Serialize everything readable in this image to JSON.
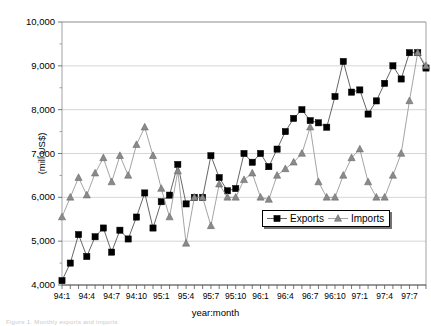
{
  "chart_data": {
    "type": "line",
    "title": "",
    "xlabel": "year:month",
    "ylabel": "(mill US$)",
    "ylim": [
      4000,
      10000
    ],
    "ytick_values": [
      4000,
      5000,
      6000,
      7000,
      8000,
      9000,
      10000
    ],
    "ytick_labels": [
      "4,000",
      "5,000",
      "6,000",
      "7,000",
      "8,000",
      "9,000",
      "10,000"
    ],
    "grid": true,
    "legend_position": "inside-lower-right",
    "x": [
      "94:1",
      "94:2",
      "94:3",
      "94:4",
      "94:5",
      "94:6",
      "94:7",
      "94:8",
      "94:9",
      "94:10",
      "94:11",
      "94:12",
      "95:1",
      "95:2",
      "95:3",
      "95:4",
      "95:5",
      "95:6",
      "95:7",
      "95:8",
      "95:9",
      "95:10",
      "95:11",
      "95:12",
      "96:1",
      "96:2",
      "96:3",
      "96:4",
      "96:5",
      "96:6",
      "96:7",
      "96:8",
      "96:9",
      "96:10",
      "96:11",
      "96:12",
      "97:1",
      "97:2",
      "97:3",
      "97:4",
      "97:5",
      "97:6",
      "97:7",
      "97:8",
      "97:9"
    ],
    "xtick_labels": [
      "94:1",
      "94:4",
      "94:7",
      "94:10",
      "95:1",
      "95:4",
      "95:7",
      "95:10",
      "96:1",
      "96:4",
      "96:7",
      "96:10",
      "97:1",
      "97:4",
      "97:7"
    ],
    "xtick_every": 3,
    "series": [
      {
        "name": "Exports",
        "marker": "square",
        "color": "#000000",
        "values": [
          4100,
          4500,
          5150,
          4650,
          5100,
          5300,
          4750,
          5250,
          5050,
          5550,
          6100,
          5300,
          5900,
          6050,
          6750,
          5850,
          6000,
          6000,
          6950,
          6450,
          6150,
          6200,
          7000,
          6800,
          7000,
          6700,
          7100,
          7500,
          7800,
          8000,
          7750,
          7700,
          7600,
          8300,
          9100,
          8400,
          8450,
          7900,
          8200,
          8600,
          9000,
          8700,
          9300,
          9300,
          8950
        ]
      },
      {
        "name": "Imports",
        "marker": "triangle",
        "color": "#8a8a8a",
        "values": [
          5550,
          6000,
          6450,
          6050,
          6550,
          6900,
          6350,
          6950,
          6500,
          7200,
          7600,
          6950,
          6200,
          5550,
          6600,
          4950,
          6000,
          6000,
          5350,
          6300,
          6000,
          6000,
          6400,
          6550,
          6000,
          5950,
          6500,
          6650,
          6800,
          7000,
          7600,
          6350,
          6000,
          6000,
          6500,
          6900,
          7100,
          6350,
          6000,
          6000,
          6500,
          7000,
          8200,
          9300,
          9000
        ]
      }
    ]
  },
  "legend": {
    "entries": [
      {
        "label": "Exports"
      },
      {
        "label": "Imports"
      }
    ]
  },
  "caption": {
    "partial_text": "Figure 1. Monthly exports and imports"
  }
}
